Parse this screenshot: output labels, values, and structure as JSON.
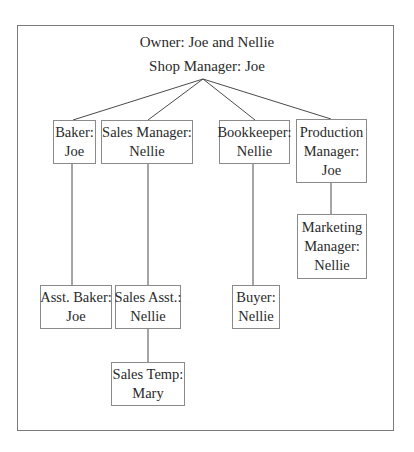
{
  "header": {
    "owner": "Owner: Joe and Nellie",
    "shop_manager": "Shop Manager: Joe"
  },
  "colors": {
    "frame": "#7a7a7a",
    "box_border": "#8a8a8a",
    "line": "#4a4a4a",
    "text": "#2a2a2a"
  },
  "nodes": {
    "baker": {
      "role": "Baker:",
      "name": "Joe"
    },
    "sales_manager": {
      "role": "Sales Manager:",
      "name": "Nellie"
    },
    "bookkeeper": {
      "role": "Bookkeeper:",
      "name": "Nellie"
    },
    "production_manager": {
      "role_line1": "Production",
      "role_line2": "Manager:",
      "name": "Joe"
    },
    "marketing_manager": {
      "role_line1": "Marketing",
      "role_line2": "Manager:",
      "name": "Nellie"
    },
    "asst_baker": {
      "role": "Asst. Baker:",
      "name": "Joe"
    },
    "sales_asst": {
      "role": "Sales Asst.:",
      "name": "Nellie"
    },
    "buyer": {
      "role": "Buyer:",
      "name": "Nellie"
    },
    "sales_temp": {
      "role": "Sales Temp:",
      "name": "Mary"
    }
  },
  "edges": [
    {
      "from": "shop_manager",
      "to": "baker"
    },
    {
      "from": "shop_manager",
      "to": "sales_manager"
    },
    {
      "from": "shop_manager",
      "to": "bookkeeper"
    },
    {
      "from": "shop_manager",
      "to": "production_manager"
    },
    {
      "from": "baker",
      "to": "asst_baker"
    },
    {
      "from": "sales_manager",
      "to": "sales_asst"
    },
    {
      "from": "sales_asst",
      "to": "sales_temp"
    },
    {
      "from": "bookkeeper",
      "to": "buyer"
    },
    {
      "from": "production_manager",
      "to": "marketing_manager"
    }
  ]
}
